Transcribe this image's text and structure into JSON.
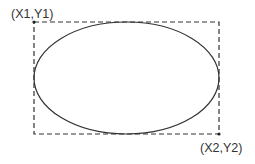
{
  "diagram": {
    "title": "",
    "labels": {
      "top_left": "(X1,Y1)",
      "bottom_right": "(X2,Y2)"
    },
    "bounding_box": {
      "x1": 34,
      "y1": 22,
      "x2": 219,
      "y2": 134,
      "style": "dashed",
      "stroke": "#333333"
    },
    "ellipse": {
      "cx": 126.5,
      "cy": 78,
      "rx": 92.5,
      "ry": 56,
      "stroke": "#333333"
    },
    "corner_markers": [
      "top-left",
      "bottom-right"
    ]
  }
}
